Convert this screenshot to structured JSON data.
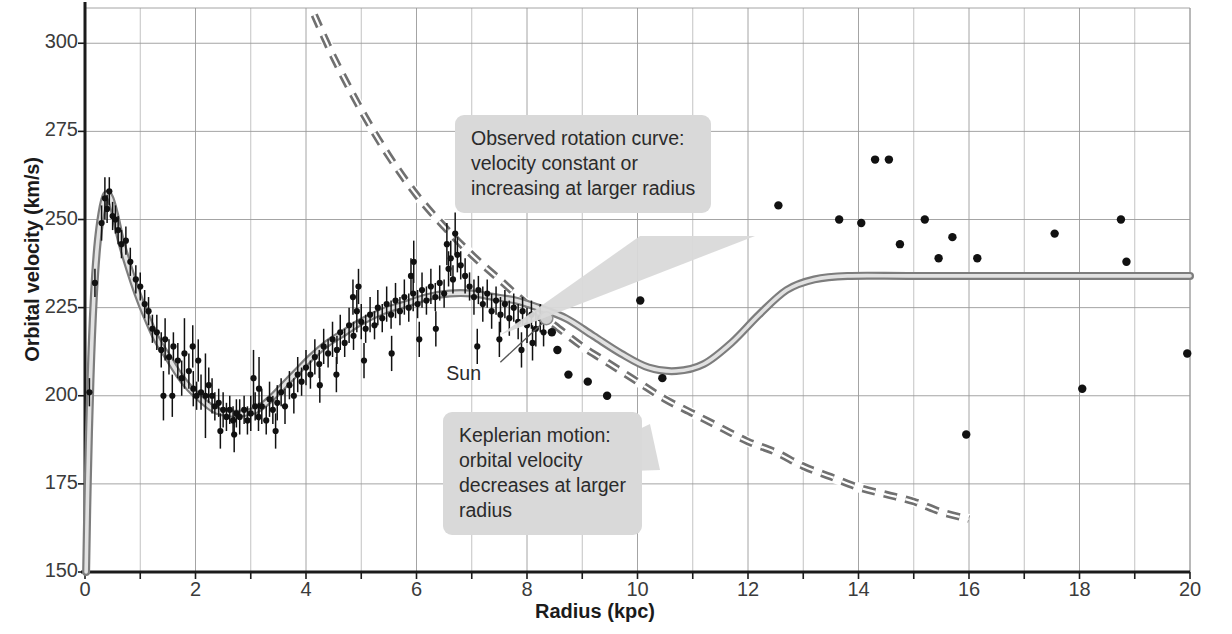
{
  "figure": {
    "xlabel": "Radius (kpc)",
    "ylabel": "Orbital velocity (km/s)",
    "credit": "Adapted from a diagram by Françoise Combes"
  },
  "annotations": {
    "observed": "Observed rotation curve:\nvelocity constant or\nincreasing at larger radius",
    "keplerian": "Keplerian motion:\norbital velocity\ndecreases at larger\nradius",
    "sun": "Sun"
  },
  "colors": {
    "background": "#ffffff",
    "grid": "#9a9a9a",
    "axis": "#1b1b1b",
    "curve_solid": "#8c8c8c",
    "curve_dashed": "#707070",
    "points": "#111111",
    "callout_bg": "#d9d9d9",
    "text": "#2b2b2b"
  },
  "chart_data": {
    "type": "scatter",
    "title": "",
    "xlabel": "Radius (kpc)",
    "ylabel": "Orbital velocity (km/s)",
    "xlim": [
      0,
      20
    ],
    "ylim": [
      150,
      310
    ],
    "grid": true,
    "xticks": [
      0,
      2,
      4,
      6,
      8,
      10,
      12,
      14,
      16,
      18,
      20
    ],
    "xticks_minor": [
      1,
      3,
      5,
      7,
      9,
      11,
      13,
      15,
      17,
      19
    ],
    "yticks": [
      150,
      175,
      200,
      225,
      250,
      275,
      300
    ],
    "legend_position": "none",
    "series": [
      {
        "name": "Observed rotation curve (model fit)",
        "type": "line",
        "style": "solid",
        "color": "#8c8c8c",
        "points": [
          [
            0.02,
            150
          ],
          [
            0.05,
            175
          ],
          [
            0.1,
            205
          ],
          [
            0.16,
            228
          ],
          [
            0.22,
            242
          ],
          [
            0.3,
            252
          ],
          [
            0.38,
            257
          ],
          [
            0.46,
            256
          ],
          [
            0.55,
            251
          ],
          [
            0.65,
            244
          ],
          [
            0.8,
            236
          ],
          [
            0.95,
            229
          ],
          [
            1.1,
            223
          ],
          [
            1.3,
            216
          ],
          [
            1.5,
            211
          ],
          [
            1.7,
            206
          ],
          [
            1.9,
            202
          ],
          [
            2.1,
            199
          ],
          [
            2.35,
            196
          ],
          [
            2.6,
            195
          ],
          [
            2.85,
            195
          ],
          [
            3.1,
            196
          ],
          [
            3.35,
            199
          ],
          [
            3.6,
            203
          ],
          [
            3.85,
            207
          ],
          [
            4.1,
            211
          ],
          [
            4.4,
            215
          ],
          [
            4.7,
            218
          ],
          [
            5.0,
            221
          ],
          [
            5.4,
            224
          ],
          [
            5.8,
            226
          ],
          [
            6.2,
            228
          ],
          [
            6.6,
            229
          ],
          [
            7.0,
            229
          ],
          [
            7.4,
            228
          ],
          [
            7.8,
            227
          ],
          [
            8.2,
            225
          ],
          [
            8.7,
            222
          ],
          [
            9.2,
            217
          ],
          [
            9.7,
            212
          ],
          [
            10.2,
            208
          ],
          [
            10.7,
            207
          ],
          [
            11.2,
            209
          ],
          [
            11.7,
            215
          ],
          [
            12.2,
            223
          ],
          [
            12.7,
            230
          ],
          [
            13.2,
            233
          ],
          [
            13.8,
            234
          ],
          [
            15.0,
            234
          ],
          [
            17.0,
            234
          ],
          [
            20.0,
            234
          ]
        ]
      },
      {
        "name": "Keplerian motion",
        "type": "line",
        "style": "dashed",
        "color": "#707070",
        "points": [
          [
            4.15,
            308
          ],
          [
            4.5,
            296
          ],
          [
            5.0,
            281
          ],
          [
            5.5,
            268
          ],
          [
            6.0,
            257
          ],
          [
            6.5,
            248
          ],
          [
            7.0,
            240
          ],
          [
            7.5,
            233
          ],
          [
            8.0,
            226
          ],
          [
            8.5,
            220
          ],
          [
            9.0,
            214
          ],
          [
            9.5,
            209
          ],
          [
            10.0,
            204
          ],
          [
            10.5,
            199
          ],
          [
            11.0,
            195
          ],
          [
            11.5,
            191
          ],
          [
            12.0,
            187
          ],
          [
            12.5,
            184
          ],
          [
            13.0,
            180
          ],
          [
            13.5,
            177
          ],
          [
            14.0,
            174
          ],
          [
            14.5,
            172
          ],
          [
            15.0,
            170
          ],
          [
            15.5,
            167
          ],
          [
            16.0,
            165
          ]
        ]
      },
      {
        "name": "Observed data (outer, single points)",
        "type": "scatter",
        "color": "#111111",
        "points": [
          [
            8.45,
            218
          ],
          [
            8.55,
            213
          ],
          [
            8.75,
            206
          ],
          [
            9.1,
            204
          ],
          [
            9.45,
            200
          ],
          [
            10.05,
            227
          ],
          [
            10.45,
            205
          ],
          [
            12.55,
            254
          ],
          [
            13.65,
            250
          ],
          [
            14.05,
            249
          ],
          [
            14.3,
            267
          ],
          [
            14.55,
            267
          ],
          [
            14.75,
            243
          ],
          [
            15.2,
            250
          ],
          [
            15.45,
            239
          ],
          [
            15.7,
            245
          ],
          [
            15.95,
            189
          ],
          [
            16.15,
            239
          ],
          [
            17.55,
            246
          ],
          [
            18.05,
            202
          ],
          [
            18.75,
            250
          ],
          [
            18.85,
            238
          ],
          [
            19.95,
            212
          ]
        ]
      },
      {
        "name": "Observed data (inner, with error bars)",
        "type": "scatter-errorbar",
        "color": "#111111",
        "note": "Dense HI/CO rotation measurements, ~0.1-8.3 kpc, err ~2-10 km/s",
        "points": [
          [
            0.08,
            201,
            4
          ],
          [
            0.18,
            232,
            4
          ],
          [
            0.3,
            249,
            5
          ],
          [
            0.36,
            256,
            6
          ],
          [
            0.4,
            253,
            4
          ],
          [
            0.44,
            258,
            4
          ],
          [
            0.5,
            251,
            4
          ],
          [
            0.55,
            250,
            4
          ],
          [
            0.6,
            247,
            4
          ],
          [
            0.66,
            243,
            4
          ],
          [
            0.74,
            244,
            4
          ],
          [
            0.82,
            238,
            4
          ],
          [
            0.92,
            233,
            4
          ],
          [
            1.0,
            231,
            4
          ],
          [
            1.08,
            226,
            4
          ],
          [
            1.15,
            224,
            4
          ],
          [
            1.22,
            219,
            4
          ],
          [
            1.3,
            218,
            5
          ],
          [
            1.38,
            213,
            5
          ],
          [
            1.45,
            216,
            6
          ],
          [
            1.52,
            211,
            5
          ],
          [
            1.6,
            214,
            4
          ],
          [
            1.68,
            210,
            5
          ],
          [
            1.75,
            205,
            5
          ],
          [
            1.8,
            212,
            10
          ],
          [
            1.88,
            207,
            5
          ],
          [
            1.96,
            202,
            5
          ],
          [
            2.02,
            200,
            4
          ],
          [
            2.1,
            201,
            5
          ],
          [
            2.18,
            200,
            12
          ],
          [
            2.24,
            203,
            5
          ],
          [
            2.3,
            200,
            5
          ],
          [
            2.35,
            197,
            4
          ],
          [
            2.42,
            198,
            4
          ],
          [
            2.5,
            196,
            5
          ],
          [
            2.56,
            194,
            4
          ],
          [
            2.62,
            196,
            4
          ],
          [
            2.68,
            193,
            4
          ],
          [
            2.74,
            195,
            4
          ],
          [
            2.8,
            194,
            5
          ],
          [
            2.88,
            196,
            4
          ],
          [
            2.94,
            193,
            4
          ],
          [
            3.0,
            195,
            5
          ],
          [
            3.08,
            197,
            4
          ],
          [
            3.14,
            194,
            4
          ],
          [
            3.2,
            197,
            5
          ],
          [
            3.28,
            193,
            4
          ],
          [
            3.34,
            199,
            5
          ],
          [
            3.4,
            196,
            4
          ],
          [
            3.48,
            198,
            5
          ],
          [
            3.55,
            201,
            4
          ],
          [
            3.62,
            197,
            5
          ],
          [
            3.7,
            203,
            4
          ],
          [
            3.78,
            200,
            5
          ],
          [
            3.85,
            206,
            5
          ],
          [
            3.92,
            204,
            4
          ],
          [
            4.0,
            208,
            5
          ],
          [
            4.08,
            206,
            4
          ],
          [
            4.16,
            211,
            5
          ],
          [
            4.24,
            209,
            4
          ],
          [
            4.32,
            214,
            5
          ],
          [
            4.4,
            212,
            4
          ],
          [
            4.48,
            216,
            5
          ],
          [
            4.56,
            213,
            4
          ],
          [
            4.62,
            218,
            5
          ],
          [
            4.7,
            215,
            4
          ],
          [
            4.78,
            220,
            5
          ],
          [
            4.86,
            217,
            4
          ],
          [
            4.92,
            224,
            6
          ],
          [
            5.0,
            221,
            5
          ],
          [
            5.08,
            219,
            4
          ],
          [
            5.16,
            223,
            5
          ],
          [
            5.24,
            220,
            4
          ],
          [
            5.3,
            225,
            5
          ],
          [
            5.38,
            222,
            4
          ],
          [
            5.46,
            226,
            5
          ],
          [
            5.54,
            223,
            4
          ],
          [
            5.62,
            227,
            5
          ],
          [
            5.7,
            224,
            4
          ],
          [
            5.78,
            228,
            5
          ],
          [
            5.86,
            225,
            4
          ],
          [
            5.94,
            229,
            5
          ],
          [
            6.02,
            226,
            4
          ],
          [
            6.1,
            230,
            5
          ],
          [
            6.18,
            227,
            4
          ],
          [
            6.26,
            231,
            5
          ],
          [
            6.34,
            228,
            4
          ],
          [
            6.42,
            232,
            5
          ],
          [
            6.5,
            229,
            4
          ],
          [
            6.58,
            236,
            5
          ],
          [
            6.66,
            233,
            4
          ],
          [
            6.74,
            240,
            5
          ],
          [
            6.8,
            237,
            4
          ],
          [
            6.88,
            234,
            5
          ],
          [
            6.96,
            231,
            4
          ],
          [
            7.04,
            228,
            5
          ],
          [
            7.12,
            230,
            4
          ],
          [
            7.2,
            226,
            5
          ],
          [
            7.28,
            229,
            4
          ],
          [
            7.36,
            224,
            5
          ],
          [
            7.44,
            227,
            4
          ],
          [
            7.52,
            223,
            5
          ],
          [
            7.6,
            226,
            4
          ],
          [
            7.68,
            222,
            5
          ],
          [
            7.76,
            225,
            4
          ],
          [
            7.84,
            221,
            5
          ],
          [
            7.92,
            224,
            4
          ],
          [
            8.0,
            220,
            5
          ],
          [
            8.08,
            223,
            4
          ],
          [
            8.16,
            219,
            5
          ],
          [
            8.24,
            222,
            4
          ],
          [
            8.3,
            218,
            4
          ],
          [
            1.95,
            214,
            6
          ],
          [
            2.05,
            210,
            6
          ],
          [
            3.05,
            205,
            8
          ],
          [
            3.15,
            202,
            9
          ],
          [
            4.25,
            203,
            5
          ],
          [
            4.55,
            206,
            5
          ],
          [
            5.05,
            210,
            5
          ],
          [
            5.55,
            212,
            5
          ],
          [
            6.05,
            216,
            5
          ],
          [
            6.35,
            219,
            5
          ],
          [
            6.55,
            243,
            6
          ],
          [
            6.62,
            239,
            5
          ],
          [
            6.7,
            246,
            6
          ],
          [
            7.1,
            214,
            5
          ],
          [
            7.5,
            216,
            5
          ],
          [
            7.9,
            213,
            5
          ],
          [
            8.1,
            215,
            5
          ],
          [
            5.9,
            234,
            5
          ],
          [
            5.95,
            238,
            6
          ],
          [
            4.95,
            231,
            5
          ],
          [
            4.85,
            228,
            5
          ],
          [
            2.45,
            190,
            5
          ],
          [
            2.7,
            189,
            5
          ],
          [
            3.45,
            190,
            5
          ],
          [
            1.42,
            200,
            7
          ],
          [
            1.58,
            200,
            6
          ]
        ]
      }
    ],
    "sun_marker": {
      "x": 8.35,
      "y": 222,
      "label": "Sun"
    }
  }
}
